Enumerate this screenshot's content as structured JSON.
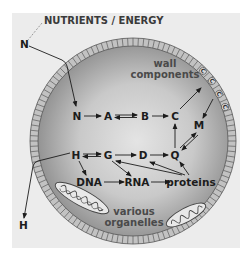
{
  "diagram": {
    "title": "NUTRIENTS / ENERGY",
    "outside": {
      "input_label": "N",
      "output_label": "H"
    },
    "regions": {
      "wall_label_line1": "wall",
      "wall_label_line2": "components",
      "organelles_line1": "various",
      "organelles_line2": "organelles"
    },
    "wall_units": [
      "C",
      "C",
      "C",
      "C"
    ],
    "nodes": {
      "N": "N",
      "A": "A",
      "B": "B",
      "C": "C",
      "M": "M",
      "H": "H",
      "G": "G",
      "D": "D",
      "Q": "Q",
      "DNA": "DNA",
      "RNA": "RNA",
      "proteins": "proteins"
    },
    "edges": [
      {
        "from": "N(outside)",
        "to": "N",
        "type": "uptake"
      },
      {
        "from": "N",
        "to": "A",
        "type": "forward"
      },
      {
        "from": "A",
        "to": "B",
        "type": "reversible"
      },
      {
        "from": "B",
        "to": "C",
        "type": "forward"
      },
      {
        "from": "C",
        "to": "wall",
        "type": "forward"
      },
      {
        "from": "wall",
        "to": "M",
        "type": "forward"
      },
      {
        "from": "Q",
        "to": "M",
        "type": "reversible"
      },
      {
        "from": "Q",
        "to": "C",
        "type": "forward"
      },
      {
        "from": "H",
        "to": "G",
        "type": "reversible"
      },
      {
        "from": "G",
        "to": "D",
        "type": "forward"
      },
      {
        "from": "D",
        "to": "Q",
        "type": "forward"
      },
      {
        "from": "H",
        "to": "DNA",
        "type": "forward"
      },
      {
        "from": "G",
        "to": "RNA",
        "type": "forward"
      },
      {
        "from": "DNA",
        "to": "RNA",
        "type": "forward"
      },
      {
        "from": "RNA",
        "to": "proteins",
        "type": "forward"
      },
      {
        "from": "proteins",
        "to": "G",
        "type": "regulation"
      },
      {
        "from": "proteins",
        "to": "D",
        "type": "regulation"
      },
      {
        "from": "proteins",
        "to": "Q",
        "type": "regulation"
      },
      {
        "from": "H",
        "to": "H(outside)",
        "type": "excretion"
      }
    ],
    "colors": {
      "page": "#ffffff",
      "panel": "#ececec",
      "wall": "#bdbdbd",
      "cytoplasm_center": "#e6e6e6",
      "cytoplasm_edge": "#8a8a8a",
      "ink": "#1c1c1c"
    }
  }
}
